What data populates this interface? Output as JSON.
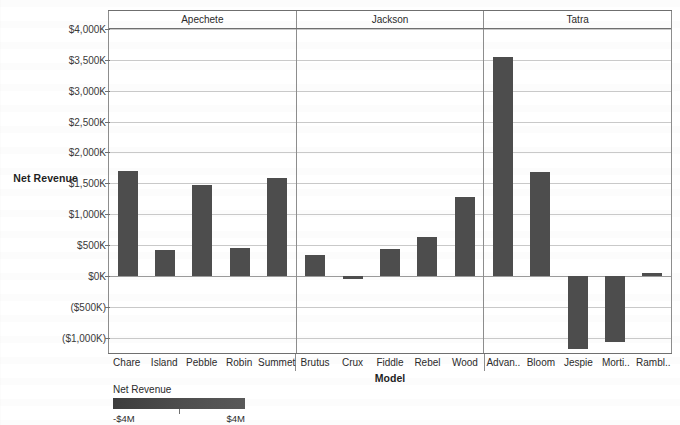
{
  "chart_data": {
    "type": "bar",
    "title": "",
    "xlabel": "Model",
    "ylabel": "Net Revenue",
    "ylim": [
      -1250,
      4000
    ],
    "yunit": "K",
    "grid": true,
    "legend_position": "bottom-left",
    "yticks": [
      {
        "value": 4000,
        "label": "$4,000K"
      },
      {
        "value": 3500,
        "label": "$3,500K"
      },
      {
        "value": 3000,
        "label": "$3,000K"
      },
      {
        "value": 2500,
        "label": "$2,500K"
      },
      {
        "value": 2000,
        "label": "$2,000K"
      },
      {
        "value": 1500,
        "label": "$1,500K"
      },
      {
        "value": 1000,
        "label": "$1,000K"
      },
      {
        "value": 500,
        "label": "$500K"
      },
      {
        "value": 0,
        "label": "$0K"
      },
      {
        "value": -500,
        "label": "($500K)"
      },
      {
        "value": -1000,
        "label": "($1,000K)"
      }
    ],
    "groups": [
      {
        "name": "Apechete",
        "categories": [
          "Chare",
          "Island",
          "Pebble",
          "Robin",
          "Summet"
        ],
        "values": [
          1700,
          420,
          1470,
          450,
          1590
        ]
      },
      {
        "name": "Jackson",
        "categories": [
          "Brutus",
          "Crux",
          "Fiddle",
          "Rebel",
          "Wood"
        ],
        "values": [
          330,
          -50,
          440,
          630,
          1280
        ]
      },
      {
        "name": "Tatra",
        "categories": [
          "Advan..",
          "Bloom",
          "Jespie",
          "Morti..",
          "Rambl.."
        ],
        "values": [
          3550,
          1690,
          -1180,
          -1080,
          40
        ]
      }
    ]
  },
  "legend": {
    "title": "Net Revenue",
    "min_label": "-$4M",
    "max_label": "$4M"
  },
  "colors": {
    "bar": "#4d4d4d",
    "grid": "#c9c9c9",
    "axis": "#6f6f6f",
    "text": "#2b2b2b"
  }
}
